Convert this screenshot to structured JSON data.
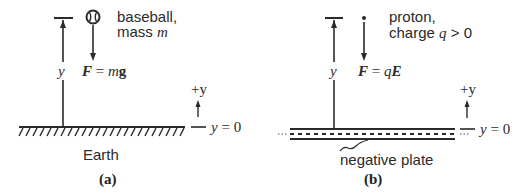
{
  "panels": {
    "a": {
      "caption": "(a)",
      "object_label_line1": "baseball,",
      "object_label_line2_prefix": "mass ",
      "object_label_line2_var": "m",
      "force_lhs": "F",
      "force_eq": " = ",
      "force_rhs_coef": "m",
      "force_rhs_vec": "g",
      "height_label": "y",
      "axis_label": "+y",
      "zero_label": "y = 0",
      "surface_label": "Earth",
      "object_icon": "baseball-icon"
    },
    "b": {
      "caption": "(b)",
      "object_label_line1": "proton,",
      "object_label_line2_prefix": "charge ",
      "object_label_line2_var": "q",
      "object_label_line2_suffix": " > 0",
      "force_lhs": "F",
      "force_eq": " = ",
      "force_rhs_coef": "q",
      "force_rhs_vec": "E",
      "height_label": "y",
      "axis_label": "+y",
      "zero_label": "y = 0",
      "surface_label": "negative plate",
      "object_icon": "proton-dot-icon"
    }
  },
  "colors": {
    "ink": "#2a2a2a",
    "background": "#ffffff"
  }
}
